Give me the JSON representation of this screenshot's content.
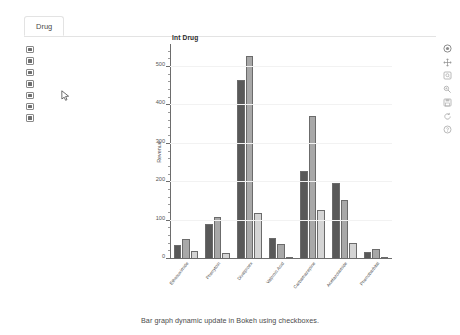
{
  "tab": {
    "label": "Drug"
  },
  "checkboxes": {
    "name": "drug-selector",
    "items": [
      {
        "label": "Ethosuximide",
        "checked": true
      },
      {
        "label": "Phenytoin",
        "checked": true
      },
      {
        "label": "Divalproex",
        "checked": true
      },
      {
        "label": "Valproic Acid",
        "checked": true
      },
      {
        "label": "Carbamazepine",
        "checked": true
      },
      {
        "label": "Acetazolamide",
        "checked": true
      },
      {
        "label": "Phenobarbital",
        "checked": true
      }
    ]
  },
  "toolbar": {
    "items": [
      {
        "name": "bokeh-logo-icon",
        "label": "Bokeh"
      },
      {
        "name": "pan-tool-icon",
        "label": "Pan"
      },
      {
        "name": "box-zoom-icon",
        "label": "Box Zoom"
      },
      {
        "name": "wheel-zoom-icon",
        "label": "Wheel Zoom"
      },
      {
        "name": "save-icon",
        "label": "Save"
      },
      {
        "name": "reset-icon",
        "label": "Reset"
      },
      {
        "name": "help-icon",
        "label": "Help"
      }
    ]
  },
  "caption": {
    "text": "Bar graph dynamic update in Bokeh using checkboxes."
  },
  "colors": {
    "series1": "#595959",
    "series2": "#a8a8a8",
    "series3": "#d4d4d4",
    "axis": "#6d6d6d",
    "grid": "#f2f2f2"
  },
  "chart_data": {
    "type": "bar",
    "title": "Int Drug",
    "xlabel": "",
    "ylabel": "Revenue",
    "ylim": [
      0,
      560
    ],
    "yticks": [
      0,
      100,
      200,
      300,
      400,
      500
    ],
    "grid": true,
    "legend": "none",
    "categories": [
      "Ethosuximide",
      "Phenytoin",
      "Divalproex",
      "Valproic Acid",
      "Carbamazepine",
      "Acetazolamide",
      "Phenobarbital"
    ],
    "series": [
      {
        "name": "Series 1",
        "color": "#595959",
        "values": [
          37,
          92,
          465,
          55,
          228,
          199,
          17
        ]
      },
      {
        "name": "Series 2",
        "color": "#a8a8a8",
        "values": [
          53,
          110,
          530,
          38,
          373,
          155,
          26
        ]
      },
      {
        "name": "Series 3",
        "color": "#d4d4d4",
        "values": [
          21,
          15,
          120,
          5,
          127,
          43,
          2
        ]
      }
    ]
  }
}
